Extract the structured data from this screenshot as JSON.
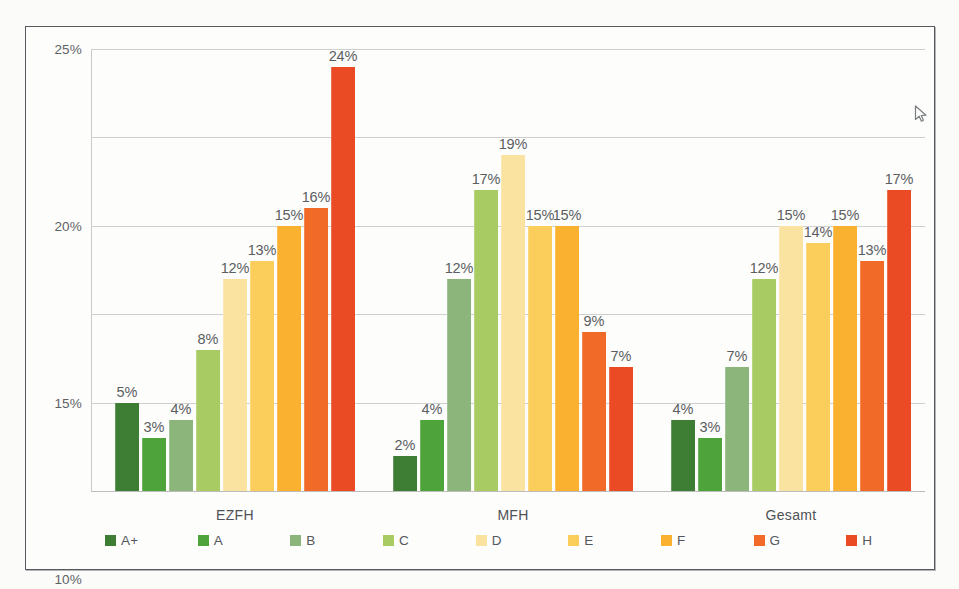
{
  "chart_data": {
    "type": "bar",
    "title": "",
    "subtitle": "",
    "xlabel": "",
    "ylabel": "",
    "categories": [
      "EZFH",
      "MFH",
      "Gesamt"
    ],
    "ylim": [
      0,
      25
    ],
    "yticks": [
      "0%",
      "5%",
      "10%",
      "15%",
      "20%",
      "25%"
    ],
    "ytick_values": [
      0,
      5,
      10,
      15,
      20,
      25
    ],
    "grid": true,
    "legend_position": "bottom",
    "series": [
      {
        "name": "A+",
        "color": "#3d7d34",
        "values": [
          5,
          2,
          4
        ]
      },
      {
        "name": "A",
        "color": "#4ea33a",
        "values": [
          3,
          4,
          3
        ]
      },
      {
        "name": "B",
        "color": "#8cb57c",
        "values": [
          4,
          12,
          7
        ]
      },
      {
        "name": "C",
        "color": "#a8cc63",
        "values": [
          8,
          17,
          12
        ]
      },
      {
        "name": "D",
        "color": "#fae2a1",
        "values": [
          12,
          19,
          15
        ]
      },
      {
        "name": "E",
        "color": "#fbcd5a",
        "values": [
          13,
          15,
          14
        ]
      },
      {
        "name": "F",
        "color": "#fbb130",
        "values": [
          15,
          15,
          15
        ]
      },
      {
        "name": "G",
        "color": "#f26a27",
        "values": [
          16,
          9,
          13
        ]
      },
      {
        "name": "H",
        "color": "#ea4a24",
        "values": [
          24,
          7,
          17
        ]
      }
    ],
    "bar_labels": [
      [
        "5%",
        "3%",
        "4%",
        "8%",
        "12%",
        "13%",
        "15%",
        "16%",
        "24%"
      ],
      [
        "2%",
        "4%",
        "12%",
        "17%",
        "19%",
        "15%",
        "15%",
        "9%",
        "7%"
      ],
      [
        "4%",
        "3%",
        "7%",
        "12%",
        "15%",
        "14%",
        "15%",
        "13%",
        "17%"
      ]
    ]
  },
  "legend": {
    "items": [
      {
        "label": "A+",
        "color": "#3d7d34"
      },
      {
        "label": "A",
        "color": "#4ea33a"
      },
      {
        "label": "B",
        "color": "#8cb57c"
      },
      {
        "label": "C",
        "color": "#a8cc63"
      },
      {
        "label": "D",
        "color": "#fae2a1"
      },
      {
        "label": "E",
        "color": "#fbcd5a"
      },
      {
        "label": "F",
        "color": "#fbb130"
      },
      {
        "label": "G",
        "color": "#f26a27"
      },
      {
        "label": "H",
        "color": "#ea4a24"
      }
    ]
  },
  "cursor": {
    "icon": "mouse-pointer",
    "x": 888,
    "y": 78
  }
}
